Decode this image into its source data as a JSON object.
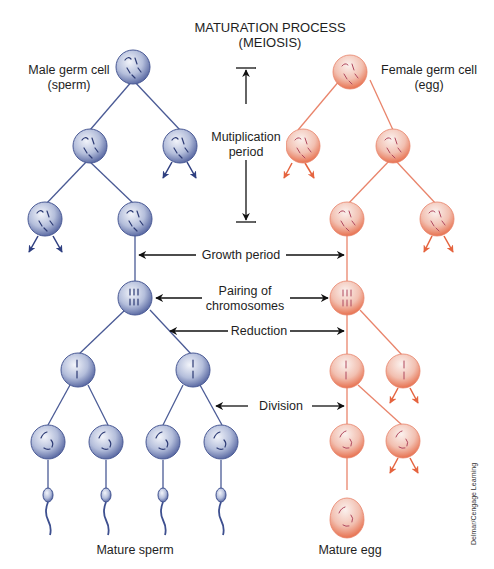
{
  "title": {
    "line1": "MATURATION PROCESS",
    "line2": "(MEIOSIS)"
  },
  "male": {
    "label_line1": "Male germ cell",
    "label_line2": "(sperm)",
    "bottom_label": "Mature sperm",
    "color": "#3d4f8f",
    "cell_fill": "#b6c0dc"
  },
  "female": {
    "label_line1": "Female germ cell",
    "label_line2": "(egg)",
    "bottom_label": "Mature egg",
    "color": "#e5735a",
    "cell_fill": "#f4b7a6"
  },
  "stages": {
    "multiplication_line1": "Mutiplication",
    "multiplication_line2": "period",
    "growth": "Growth period",
    "pairing_line1": "Pairing of",
    "pairing_line2": "chromosomes",
    "reduction": "Reduction",
    "division": "Division"
  },
  "credit": "Delmar/Cengage Learning"
}
